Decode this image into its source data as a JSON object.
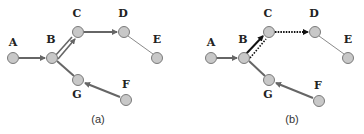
{
  "figure": {
    "panels": [
      {
        "id": "a",
        "caption": "(a)",
        "nodes": [
          {
            "label": "A",
            "x": 13,
            "y": 58,
            "lx": 13,
            "ly": 46
          },
          {
            "label": "B",
            "x": 52,
            "y": 58,
            "lx": 51,
            "ly": 43
          },
          {
            "label": "C",
            "x": 78,
            "y": 32,
            "lx": 77,
            "ly": 17
          },
          {
            "label": "D",
            "x": 124,
            "y": 32,
            "lx": 123,
            "ly": 17
          },
          {
            "label": "E",
            "x": 157,
            "y": 58,
            "lx": 157,
            "ly": 43
          },
          {
            "label": "G",
            "x": 78,
            "y": 80,
            "lx": 77,
            "ly": 98
          },
          {
            "label": "F",
            "x": 126,
            "y": 100,
            "lx": 126,
            "ly": 88
          }
        ],
        "caption_pos": {
          "x": 98,
          "y": 123
        }
      },
      {
        "id": "b",
        "caption": "(b)",
        "nodes": [
          {
            "label": "A",
            "x": 211,
            "y": 58,
            "lx": 211,
            "ly": 46
          },
          {
            "label": "B",
            "x": 244,
            "y": 58,
            "lx": 243,
            "ly": 43
          },
          {
            "label": "C",
            "x": 269,
            "y": 32,
            "lx": 268,
            "ly": 17
          },
          {
            "label": "D",
            "x": 315,
            "y": 32,
            "lx": 314,
            "ly": 17
          },
          {
            "label": "E",
            "x": 348,
            "y": 58,
            "lx": 348,
            "ly": 43
          },
          {
            "label": "G",
            "x": 269,
            "y": 80,
            "lx": 268,
            "ly": 98
          },
          {
            "label": "F",
            "x": 319,
            "y": 101,
            "lx": 318,
            "ly": 89
          }
        ],
        "caption_pos": {
          "x": 292,
          "y": 123
        }
      }
    ],
    "colors": {
      "node_fill": "#c8c8c8",
      "node_stroke": "#7a7a7a",
      "edge": "#666666",
      "edge_dark": "#222222",
      "thin_edge": "#8a8a8a"
    }
  }
}
